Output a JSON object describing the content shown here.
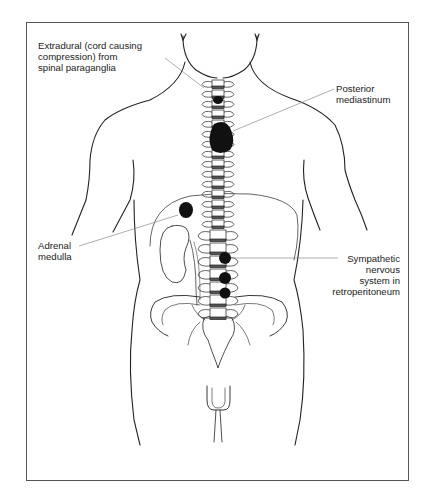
{
  "figure": {
    "colors": {
      "line": "#222222",
      "tumour": "#111111",
      "leader": "#777777",
      "frame": "#555555"
    }
  },
  "labels": {
    "extradural": [
      "Extradural (cord causing",
      "compression) from",
      "spinal paraganglia"
    ],
    "posterior_mediastinum": [
      "Posterior",
      "mediastinum"
    ],
    "adrenal_medulla": [
      "Adrenal",
      "medulla"
    ],
    "sympathetic": [
      "Sympathetic",
      "nervous",
      "system in",
      "retroperitoneum"
    ]
  },
  "tumours": [
    {
      "site": "spinal paraganglia (extradural)"
    },
    {
      "site": "posterior mediastinum"
    },
    {
      "site": "adrenal medulla"
    },
    {
      "site": "retroperitoneal sympathetic chain (upper)"
    },
    {
      "site": "retroperitoneal sympathetic chain (middle)"
    },
    {
      "site": "retroperitoneal sympathetic chain (lower)"
    }
  ]
}
